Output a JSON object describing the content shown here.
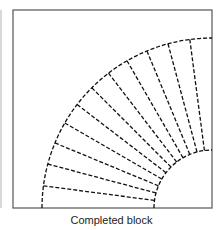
{
  "caption": "Completed block",
  "diagram": {
    "type": "quilt-block",
    "frame": {
      "x": 13,
      "y": 10,
      "width": 199,
      "height": 198
    },
    "arc_center": {
      "x": 212,
      "y": 208
    },
    "outer_radius": 170,
    "inner_radius": 58,
    "segments": 12,
    "line_color": "#111111",
    "frame_color": "#555555"
  }
}
